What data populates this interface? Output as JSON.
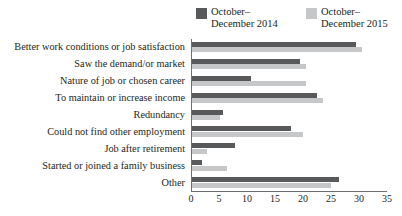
{
  "legend": {
    "position": "top-right",
    "entries": [
      {
        "label": "October–\nDecember 2014",
        "color": "#58595b",
        "name": "series-2014"
      },
      {
        "label": "October–\nDecember 2015",
        "color": "#c6c7c9",
        "name": "series-2015"
      }
    ]
  },
  "axis": {
    "ticks": [
      "0",
      "5",
      "10",
      "15",
      "20",
      "25",
      "30",
      "35"
    ]
  },
  "chart_data": {
    "type": "bar",
    "orientation": "horizontal",
    "title": "",
    "xlabel": "",
    "ylabel": "",
    "xlim": [
      0,
      35
    ],
    "xticks": [
      0,
      5,
      10,
      15,
      20,
      25,
      30,
      35
    ],
    "grid": false,
    "legend_position": "top-right",
    "categories": [
      "Better work conditions or job satisfaction",
      "Saw the demand/or market",
      "Nature of job or chosen career",
      "To maintain or increase income",
      "Redundancy",
      "Could not find other employment",
      "Job after retirement",
      "Started or joined a family business",
      "Other"
    ],
    "series": [
      {
        "name": "October–December 2014",
        "color": "#58595b",
        "values": [
          29.5,
          19.5,
          10.8,
          22.5,
          5.8,
          17.8,
          7.8,
          2.0,
          26.5
        ]
      },
      {
        "name": "October–December 2015",
        "color": "#c6c7c9",
        "values": [
          30.5,
          20.5,
          20.5,
          23.5,
          5.2,
          20.0,
          2.8,
          6.5,
          25.0
        ]
      }
    ]
  }
}
